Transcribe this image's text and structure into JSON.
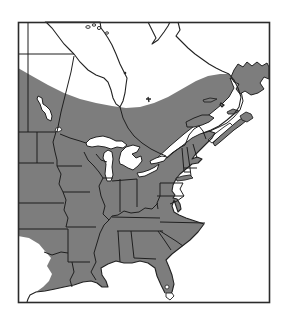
{
  "figure": {
    "type": "species-range-map",
    "region": "Eastern North America",
    "shading_meaning": "shaded area indicates species range",
    "has_text": false
  },
  "colors": {
    "background": "#ffffff",
    "water": "#ffffff",
    "unshaded_land": "#ffffff",
    "range_fill": "#7d7d7d",
    "coastline": "#222222",
    "boundary_line": "#1f1f1f",
    "frame": "#2b2b2b"
  },
  "map_features": {
    "frame": "map border rectangle",
    "shaded_range": "gray range covering eastern USA and southeastern Canada",
    "water_bodies": [
      "Hudson Bay",
      "James Bay",
      "Lake Winnipeg",
      "Lake of the Woods",
      "Lake Superior",
      "Lake Michigan",
      "Lake Huron",
      "Lake Erie",
      "Lake Ontario",
      "St. Lawrence Gulf and Estuary",
      "Bay of Fundy",
      "Atlantic Ocean",
      "Gulf of Mexico",
      "Lake Okeechobee"
    ],
    "land_features": [
      "Ungava and Labrador coast",
      "Newfoundland",
      "Nova Scotia",
      "Cape Breton Island",
      "Prince Edward Island",
      "Anticosti Island",
      "Magdalen Islands",
      "Gaspe Peninsula",
      "Long Island",
      "Cape Cod",
      "Florida peninsula with unshaded tip",
      "unshaded west Texas and Mexico"
    ],
    "boundaries": [
      "US-Canada border",
      "provincial borders Manitoba Saskatchewan Ontario Quebec",
      "US state borders",
      "Mississippi River",
      "Ohio River"
    ]
  }
}
